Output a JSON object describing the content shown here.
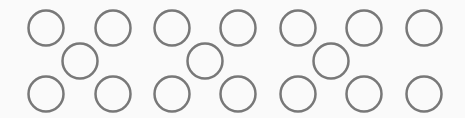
{
  "canvas": {
    "width": 465,
    "height": 118,
    "background": "#fafafa"
  },
  "style": {
    "stroke": "#787878",
    "stroke_width": 2.5,
    "radius": 17.5,
    "fill": "none"
  },
  "groups": [
    {
      "name": "group-1",
      "circles": [
        {
          "position": "top-left",
          "cx": 46,
          "cy": 28
        },
        {
          "position": "top-right",
          "cx": 113,
          "cy": 28
        },
        {
          "position": "center",
          "cx": 80,
          "cy": 61
        },
        {
          "position": "bottom-left",
          "cx": 46,
          "cy": 94
        },
        {
          "position": "bottom-right",
          "cx": 113,
          "cy": 94
        }
      ]
    },
    {
      "name": "group-2",
      "circles": [
        {
          "position": "top-left",
          "cx": 172,
          "cy": 28
        },
        {
          "position": "top-right",
          "cx": 238,
          "cy": 28
        },
        {
          "position": "center",
          "cx": 205,
          "cy": 61
        },
        {
          "position": "bottom-left",
          "cx": 172,
          "cy": 94
        },
        {
          "position": "bottom-right",
          "cx": 238,
          "cy": 94
        }
      ]
    },
    {
      "name": "group-3",
      "circles": [
        {
          "position": "top-left",
          "cx": 298,
          "cy": 28
        },
        {
          "position": "top-right",
          "cx": 364,
          "cy": 28
        },
        {
          "position": "center",
          "cx": 331,
          "cy": 61
        },
        {
          "position": "bottom-left",
          "cx": 298,
          "cy": 94
        },
        {
          "position": "bottom-right",
          "cx": 364,
          "cy": 94
        }
      ]
    },
    {
      "name": "group-4",
      "circles": [
        {
          "position": "top",
          "cx": 424,
          "cy": 28
        },
        {
          "position": "bottom",
          "cx": 424,
          "cy": 94
        }
      ]
    }
  ]
}
